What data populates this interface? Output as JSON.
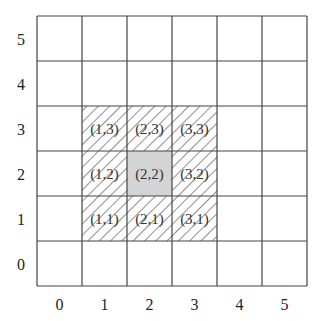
{
  "grid": {
    "cols": 6,
    "rows": 6,
    "origin_x": 37,
    "origin_y": 16,
    "cell_size": 45,
    "line_color": "#444444",
    "x_labels": [
      "0",
      "1",
      "2",
      "3",
      "4",
      "5"
    ],
    "y_labels": [
      "0",
      "1",
      "2",
      "3",
      "4",
      "5"
    ]
  },
  "highlight": {
    "center": {
      "x": 2,
      "y": 2,
      "label": "(2,2)",
      "fill": "#d4d4d4"
    },
    "neighbors": [
      {
        "x": 1,
        "y": 3,
        "label": "(1,3)"
      },
      {
        "x": 2,
        "y": 3,
        "label": "(2,3)"
      },
      {
        "x": 3,
        "y": 3,
        "label": "(3,3)"
      },
      {
        "x": 1,
        "y": 2,
        "label": "(1,2)"
      },
      {
        "x": 3,
        "y": 2,
        "label": "(3,2)"
      },
      {
        "x": 1,
        "y": 1,
        "label": "(1,1)"
      },
      {
        "x": 2,
        "y": 1,
        "label": "(2,1)"
      },
      {
        "x": 3,
        "y": 1,
        "label": "(3,1)"
      }
    ],
    "hatch_color": "#444444"
  }
}
